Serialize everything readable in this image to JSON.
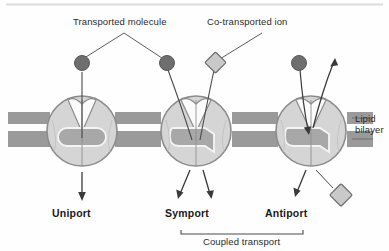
{
  "figure": {
    "title_top_rule": true,
    "labels": {
      "transported_molecule": "Transported molecule",
      "cotransported_ion": "Co-transported ion",
      "lipid_bilayer_line1": "Lipid",
      "lipid_bilayer_line2": "bilayer",
      "uniport": "Uniport",
      "symport": "Symport",
      "antiport": "Antiport",
      "coupled_transport": "Coupled transport"
    },
    "colors": {
      "molecule_circle": "#6e6e6e",
      "ion_diamond": "#c9c9c9",
      "ion_diamond_stroke": "#6b6b6b",
      "membrane_band": "#9a9a9a",
      "protein_fill": "#d5d5d5",
      "protein_stroke": "#8c8c8c",
      "channel_fill": "#a8a8a8",
      "arrow": "#3a3a3a",
      "text": "#2b2b2b",
      "top_rule": "#d8d8d8"
    },
    "transporters": [
      {
        "name": "uniport",
        "label": "Uniport",
        "molecules_above": [
          "circle"
        ],
        "arrows_below": 1,
        "arrows_above": 0
      },
      {
        "name": "symport",
        "label": "Symport",
        "molecules_above": [
          "circle",
          "diamond"
        ],
        "arrows_below": 2,
        "arrows_above": 0
      },
      {
        "name": "antiport",
        "label": "Antiport",
        "molecules_above": [
          "circle"
        ],
        "arrows_below": 1,
        "arrows_above": 1,
        "molecules_below": [
          "diamond"
        ]
      }
    ]
  }
}
